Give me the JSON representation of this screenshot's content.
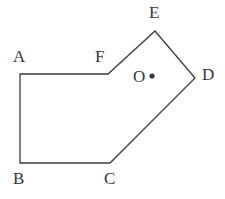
{
  "figure": {
    "background_color": "#ffffff",
    "stroke_color": "#3a3a42",
    "text_color": "#35353d",
    "stroke_width": 1.3,
    "width": 225,
    "height": 199,
    "shape": {
      "name": "hexagon-abcdef",
      "closed": true,
      "vertices": [
        {
          "id": "A",
          "x": 20,
          "y": 74
        },
        {
          "id": "B",
          "x": 20,
          "y": 163
        },
        {
          "id": "C",
          "x": 110,
          "y": 163
        },
        {
          "id": "D",
          "x": 195,
          "y": 78
        },
        {
          "id": "E",
          "x": 155,
          "y": 31
        },
        {
          "id": "F",
          "x": 108,
          "y": 74
        }
      ],
      "edges": [
        {
          "from": "A",
          "to": "B"
        },
        {
          "from": "B",
          "to": "C"
        },
        {
          "from": "C",
          "to": "D"
        },
        {
          "from": "D",
          "to": "E"
        },
        {
          "from": "E",
          "to": "F"
        },
        {
          "from": "F",
          "to": "A"
        }
      ]
    },
    "interior_point": {
      "id": "O",
      "label": "O",
      "dot_x": 152,
      "dot_y": 76,
      "dot_radius": 2.6,
      "label_x": 133,
      "label_y": 68
    },
    "labels": [
      {
        "id": "A",
        "text": "A",
        "x": 13,
        "y": 48
      },
      {
        "id": "B",
        "text": "B",
        "x": 13,
        "y": 170
      },
      {
        "id": "C",
        "text": "C",
        "x": 104,
        "y": 170
      },
      {
        "id": "D",
        "text": "D",
        "x": 202,
        "y": 66
      },
      {
        "id": "E",
        "text": "E",
        "x": 149,
        "y": 4
      },
      {
        "id": "F",
        "text": "F",
        "x": 95,
        "y": 48
      }
    ]
  }
}
